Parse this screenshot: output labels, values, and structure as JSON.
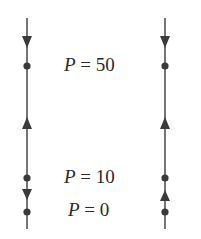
{
  "diagram": {
    "type": "phase-lines",
    "line_color": "#3a3a3a",
    "phase_lines": [
      {
        "id": "left",
        "equilibria": [
          50,
          10,
          0
        ],
        "arrows": [
          {
            "between": "above 50",
            "direction": "down"
          },
          {
            "between": "10-50",
            "direction": "up"
          },
          {
            "between": "0-10",
            "direction": "down"
          }
        ]
      },
      {
        "id": "right",
        "equilibria": [
          50,
          10,
          0
        ],
        "arrows": [
          {
            "between": "above 50",
            "direction": "down"
          },
          {
            "between": "10-50",
            "direction": "up"
          },
          {
            "between": "0-10",
            "direction": "up"
          }
        ]
      }
    ],
    "labels": [
      {
        "var": "P",
        "eq": " = 50"
      },
      {
        "var": "P",
        "eq": " = 10"
      },
      {
        "var": "P",
        "eq": " = 0"
      }
    ]
  }
}
